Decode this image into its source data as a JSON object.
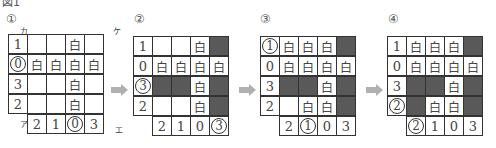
{
  "figure": {
    "title": "図1",
    "steps": [
      {
        "label": "①",
        "corners": {
          "top_left": "カ",
          "top_right": "ケ",
          "bottom_left": "ア",
          "bottom_right": "エ"
        },
        "rows": [
          [
            {
              "t": "1",
              "hint": true
            },
            {
              "t": ""
            },
            {
              "t": ""
            },
            {
              "t": "白"
            },
            {
              "t": ""
            }
          ],
          [
            {
              "t": "0",
              "hint": true,
              "circled": true
            },
            {
              "t": "白"
            },
            {
              "t": "白"
            },
            {
              "t": "白"
            },
            {
              "t": "白"
            }
          ],
          [
            {
              "t": "3",
              "hint": true
            },
            {
              "t": ""
            },
            {
              "t": ""
            },
            {
              "t": "白"
            },
            {
              "t": ""
            }
          ],
          [
            {
              "t": "2",
              "hint": true
            },
            {
              "t": ""
            },
            {
              "t": ""
            },
            {
              "t": "白"
            },
            {
              "t": ""
            }
          ]
        ],
        "bottom": [
          {
            "t": "2"
          },
          {
            "t": "1"
          },
          {
            "t": "0",
            "circled": true
          },
          {
            "t": "3"
          }
        ]
      },
      {
        "label": "②",
        "rows": [
          [
            {
              "t": "1",
              "hint": true
            },
            {
              "t": ""
            },
            {
              "t": ""
            },
            {
              "t": "白"
            },
            {
              "t": "",
              "shade": true
            }
          ],
          [
            {
              "t": "0",
              "hint": true
            },
            {
              "t": "白"
            },
            {
              "t": "白"
            },
            {
              "t": "白"
            },
            {
              "t": "白"
            }
          ],
          [
            {
              "t": "3",
              "hint": true,
              "circled": true
            },
            {
              "t": "",
              "shade": true
            },
            {
              "t": "",
              "shade": true
            },
            {
              "t": "白"
            },
            {
              "t": "",
              "shade": true
            }
          ],
          [
            {
              "t": "2",
              "hint": true
            },
            {
              "t": ""
            },
            {
              "t": ""
            },
            {
              "t": "白"
            },
            {
              "t": "",
              "shade": true
            }
          ]
        ],
        "bottom": [
          {
            "t": "2"
          },
          {
            "t": "1"
          },
          {
            "t": "0"
          },
          {
            "t": "3",
            "circled": true
          }
        ]
      },
      {
        "label": "③",
        "rows": [
          [
            {
              "t": "1",
              "hint": true,
              "circled": true
            },
            {
              "t": "白"
            },
            {
              "t": "白"
            },
            {
              "t": "白"
            },
            {
              "t": "",
              "shade": true
            }
          ],
          [
            {
              "t": "0",
              "hint": true
            },
            {
              "t": "白"
            },
            {
              "t": "白"
            },
            {
              "t": "白"
            },
            {
              "t": "白"
            }
          ],
          [
            {
              "t": "3",
              "hint": true
            },
            {
              "t": "",
              "shade": true
            },
            {
              "t": "",
              "shade": true
            },
            {
              "t": "白"
            },
            {
              "t": "",
              "shade": true
            }
          ],
          [
            {
              "t": "2",
              "hint": true
            },
            {
              "t": ""
            },
            {
              "t": "白"
            },
            {
              "t": "白"
            },
            {
              "t": "",
              "shade": true
            }
          ]
        ],
        "bottom": [
          {
            "t": "2"
          },
          {
            "t": "1",
            "circled": true
          },
          {
            "t": "0"
          },
          {
            "t": "3"
          }
        ]
      },
      {
        "label": "④",
        "rows": [
          [
            {
              "t": "1",
              "hint": true
            },
            {
              "t": "白"
            },
            {
              "t": "白"
            },
            {
              "t": "白"
            },
            {
              "t": "",
              "shade": true
            }
          ],
          [
            {
              "t": "0",
              "hint": true
            },
            {
              "t": "白"
            },
            {
              "t": "白"
            },
            {
              "t": "白"
            },
            {
              "t": "白"
            }
          ],
          [
            {
              "t": "3",
              "hint": true
            },
            {
              "t": "",
              "shade": true
            },
            {
              "t": "",
              "shade": true
            },
            {
              "t": "白"
            },
            {
              "t": "",
              "shade": true
            }
          ],
          [
            {
              "t": "2",
              "hint": true,
              "circled": true
            },
            {
              "t": "",
              "shade": true
            },
            {
              "t": "白"
            },
            {
              "t": "白"
            },
            {
              "t": "",
              "shade": true
            }
          ]
        ],
        "bottom": [
          {
            "t": "2",
            "circled": true
          },
          {
            "t": "1"
          },
          {
            "t": "0"
          },
          {
            "t": "3"
          }
        ]
      }
    ],
    "colors": {
      "shade": "#595959",
      "arrow": "#b0b0b0",
      "border": "#333333"
    }
  }
}
